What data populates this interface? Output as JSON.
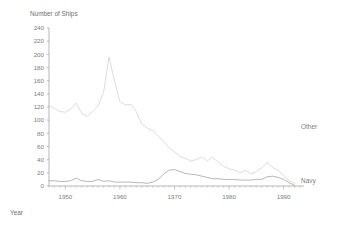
{
  "chart_data": {
    "type": "line",
    "title": "",
    "ylabel": "Number of Ships",
    "xlabel": "Year",
    "ylim": [
      0,
      240
    ],
    "xlim": [
      1947,
      1993
    ],
    "grid": false,
    "legend_position": "right-inline",
    "ytick_labels": [
      "0",
      "20",
      "40",
      "60",
      "80",
      "100",
      "120",
      "140",
      "160",
      "180",
      "200",
      "220",
      "240"
    ],
    "ytick_values": [
      0,
      20,
      40,
      60,
      80,
      100,
      120,
      140,
      160,
      180,
      200,
      220,
      240
    ],
    "xtick_labels": [
      "1950",
      "1960",
      "1970",
      "1980",
      "1990"
    ],
    "xtick_values": [
      1950,
      1960,
      1970,
      1980,
      1990
    ],
    "x": [
      1947,
      1948,
      1949,
      1950,
      1951,
      1952,
      1953,
      1954,
      1955,
      1956,
      1957,
      1958,
      1959,
      1960,
      1961,
      1962,
      1963,
      1964,
      1965,
      1966,
      1967,
      1968,
      1969,
      1970,
      1971,
      1972,
      1973,
      1974,
      1975,
      1976,
      1977,
      1978,
      1979,
      1980,
      1981,
      1982,
      1983,
      1984,
      1985,
      1986,
      1987,
      1988,
      1989,
      1990,
      1991,
      1992
    ],
    "series": [
      {
        "name": "Other",
        "color": "#cfcfcf",
        "values": [
          122,
          118,
          113,
          112,
          117,
          126,
          110,
          106,
          113,
          122,
          142,
          196,
          160,
          128,
          123,
          124,
          113,
          94,
          88,
          84,
          76,
          68,
          58,
          52,
          45,
          42,
          38,
          40,
          44,
          38,
          44,
          36,
          30,
          26,
          24,
          20,
          24,
          18,
          22,
          28,
          36,
          28,
          24,
          16,
          8,
          4
        ]
      },
      {
        "name": "Navy",
        "color": "#9e9e9e",
        "values": [
          8,
          8,
          7,
          7,
          8,
          12,
          8,
          7,
          7,
          10,
          7,
          8,
          6,
          6,
          6,
          6,
          5,
          5,
          4,
          6,
          10,
          18,
          24,
          25,
          22,
          19,
          18,
          17,
          15,
          13,
          11,
          11,
          10,
          10,
          10,
          9,
          9,
          9,
          10,
          10,
          14,
          15,
          13,
          10,
          5,
          1
        ]
      }
    ],
    "annotations": [
      {
        "text": "Other",
        "x": 1991,
        "y": 90
      },
      {
        "text": "Navy",
        "x": 1991,
        "y": 8
      }
    ]
  },
  "labels": {
    "y_axis_title": "Number of Ships",
    "x_axis_title": "Year",
    "legend_other": "Other",
    "legend_navy": "Navy"
  }
}
